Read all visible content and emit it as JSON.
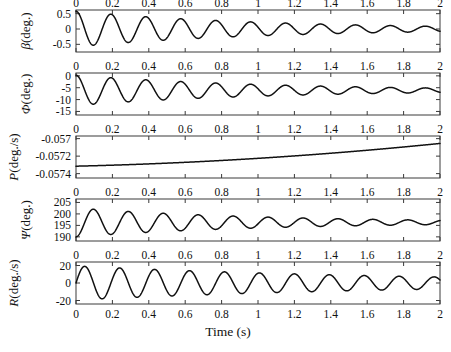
{
  "figure": {
    "background": "#ffffff",
    "line_color": "#111111",
    "axis_color": "#3a3a3a",
    "xlabel": "Time (s)"
  },
  "chart_data": {
    "type": "line",
    "title": "",
    "xlabel": "Time (s)",
    "grid": false,
    "legend": null,
    "shared_x": {
      "xlim": [
        0,
        2
      ],
      "xticks": [
        0,
        0.2,
        0.4,
        0.6,
        0.8,
        1,
        1.2,
        1.4,
        1.6,
        1.8,
        2
      ],
      "xticklabels": [
        "0",
        "0.2",
        "0.4",
        "0.6",
        "0.8",
        "1",
        "1.2",
        "1.4",
        "1.6",
        "1.8",
        "2"
      ]
    },
    "panels": [
      {
        "name": "beta",
        "ylabel": "β (deg.)",
        "ylabel_symbol": "β",
        "ylabel_unit": "(deg.)",
        "ylim": [
          -0.75,
          0.62
        ],
        "yticks": [
          0.5,
          0,
          -0.5
        ],
        "yticklabels": [
          "0.5",
          "0",
          "-0.5"
        ],
        "series": [
          {
            "name": "beta",
            "model": "damped_sine",
            "amplitude": 0.58,
            "decay": 0.95,
            "period": 0.192,
            "phase_deg": 90,
            "offset": 0.0,
            "offset_decay": 0.0
          }
        ]
      },
      {
        "name": "phi",
        "ylabel": "Φ (deg.)",
        "ylabel_symbol": "Φ",
        "ylabel_unit": "(deg.)",
        "ylim": [
          -16.5,
          1.2
        ],
        "yticks": [
          0,
          -5,
          -10,
          -15
        ],
        "yticklabels": [
          "0",
          "-5",
          "-10",
          "-15"
        ],
        "series": [
          {
            "name": "phi",
            "model": "damped_sine",
            "amplitude": 6.4,
            "decay": 0.95,
            "period": 0.192,
            "phase_deg": 90,
            "offset": -6.1,
            "offset_decay": 0.0
          }
        ]
      },
      {
        "name": "P",
        "ylabel": "P (deg./s)",
        "ylabel_symbol": "P",
        "ylabel_unit": "(deg./s)",
        "ylim": [
          -0.05745,
          -0.05697
        ],
        "yticks": [
          -0.057,
          -0.0572,
          -0.0574
        ],
        "yticklabels": [
          "-0.057",
          "-0.0572",
          "-0.0574"
        ],
        "series": [
          {
            "name": "P",
            "model": "quadratic_rise",
            "y0": -0.057315,
            "y_end": -0.057055,
            "curvature": 0.62
          }
        ]
      },
      {
        "name": "psi",
        "ylabel": "Ψ (deg.)",
        "ylabel_symbol": "Ψ",
        "ylabel_unit": "(deg.)",
        "ylim": [
          188.2,
          206.5
        ],
        "yticks": [
          205,
          200,
          195,
          190
        ],
        "yticklabels": [
          "205",
          "200",
          "195",
          "190"
        ],
        "series": [
          {
            "name": "psi",
            "model": "damped_sine",
            "amplitude": 6.3,
            "decay": 0.95,
            "period": 0.192,
            "phase_deg": -90,
            "offset": 196.3,
            "offset_decay": 0.0
          }
        ]
      },
      {
        "name": "R",
        "ylabel": "R (deg./s)",
        "ylabel_symbol": "R",
        "ylabel_unit": "(deg./s)",
        "ylim": [
          -24,
          24
        ],
        "yticks": [
          20,
          0,
          -20
        ],
        "yticklabels": [
          "20",
          "0",
          "-20"
        ],
        "series": [
          {
            "name": "R",
            "model": "damped_sine",
            "amplitude": 19.5,
            "decay": 0.52,
            "period": 0.192,
            "phase_deg": 0,
            "offset": 0.0,
            "offset_decay": 0.0
          }
        ]
      }
    ]
  }
}
